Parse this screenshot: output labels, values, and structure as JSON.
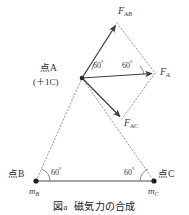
{
  "figure": {
    "kind": "physics-vector-diagram",
    "caption_label": "図a",
    "caption_text": "磁気力の合成",
    "stroke_color": "#4a4a4a",
    "dotted_color": "#8a8a8a",
    "text_color": "#2b2b2b",
    "background": "#ffffff"
  },
  "points": [
    {
      "id": "A",
      "label": "点A",
      "sublabel": "(＋1C)",
      "x": 82,
      "y": 78
    },
    {
      "id": "B",
      "label": "点B",
      "charge_label": "m",
      "charge_sub": "B",
      "x": 36,
      "y": 181
    },
    {
      "id": "C",
      "label": "点C",
      "charge_label": "m",
      "charge_sub": "C",
      "x": 154,
      "y": 181
    }
  ],
  "vectors": [
    {
      "id": "F_AB",
      "symbol": "F",
      "sub": "AB",
      "from": "A",
      "tip_x": 117,
      "tip_y": 23,
      "style": "solid-arrow"
    },
    {
      "id": "F_A",
      "symbol": "F",
      "sub": "A",
      "from": "A",
      "tip_x": 155,
      "tip_y": 73,
      "style": "solid-arrow"
    },
    {
      "id": "F_AC",
      "symbol": "F",
      "sub": "AC",
      "from": "A",
      "tip_x": 122,
      "tip_y": 119,
      "style": "solid-arrow"
    }
  ],
  "angles": [
    {
      "id": "angle-a-upper",
      "value": "60",
      "unit": "°",
      "at": "A",
      "x": 92,
      "y": 64
    },
    {
      "id": "angle-a-lower",
      "value": "60",
      "unit": "°",
      "at": "A",
      "x": 122,
      "y": 64
    },
    {
      "id": "angle-b",
      "value": "60",
      "unit": "°",
      "at": "B",
      "x": 47,
      "y": 171
    },
    {
      "id": "angle-c",
      "value": "60",
      "unit": "°",
      "at": "C",
      "x": 126,
      "y": 171
    }
  ],
  "labels": {
    "point_a": "点A",
    "point_a_charge": "(＋1C)",
    "point_b": "点B",
    "point_c": "点C",
    "m_b_symbol": "m",
    "m_b_sub": "B",
    "m_c_symbol": "m",
    "m_c_sub": "C",
    "f_ab_symbol": "F",
    "f_ab_sub": "AB",
    "f_a_symbol": "F",
    "f_a_sub": "A",
    "f_ac_symbol": "F",
    "f_ac_sub": "AC",
    "angle_value": "60",
    "degree_sign": "°"
  }
}
